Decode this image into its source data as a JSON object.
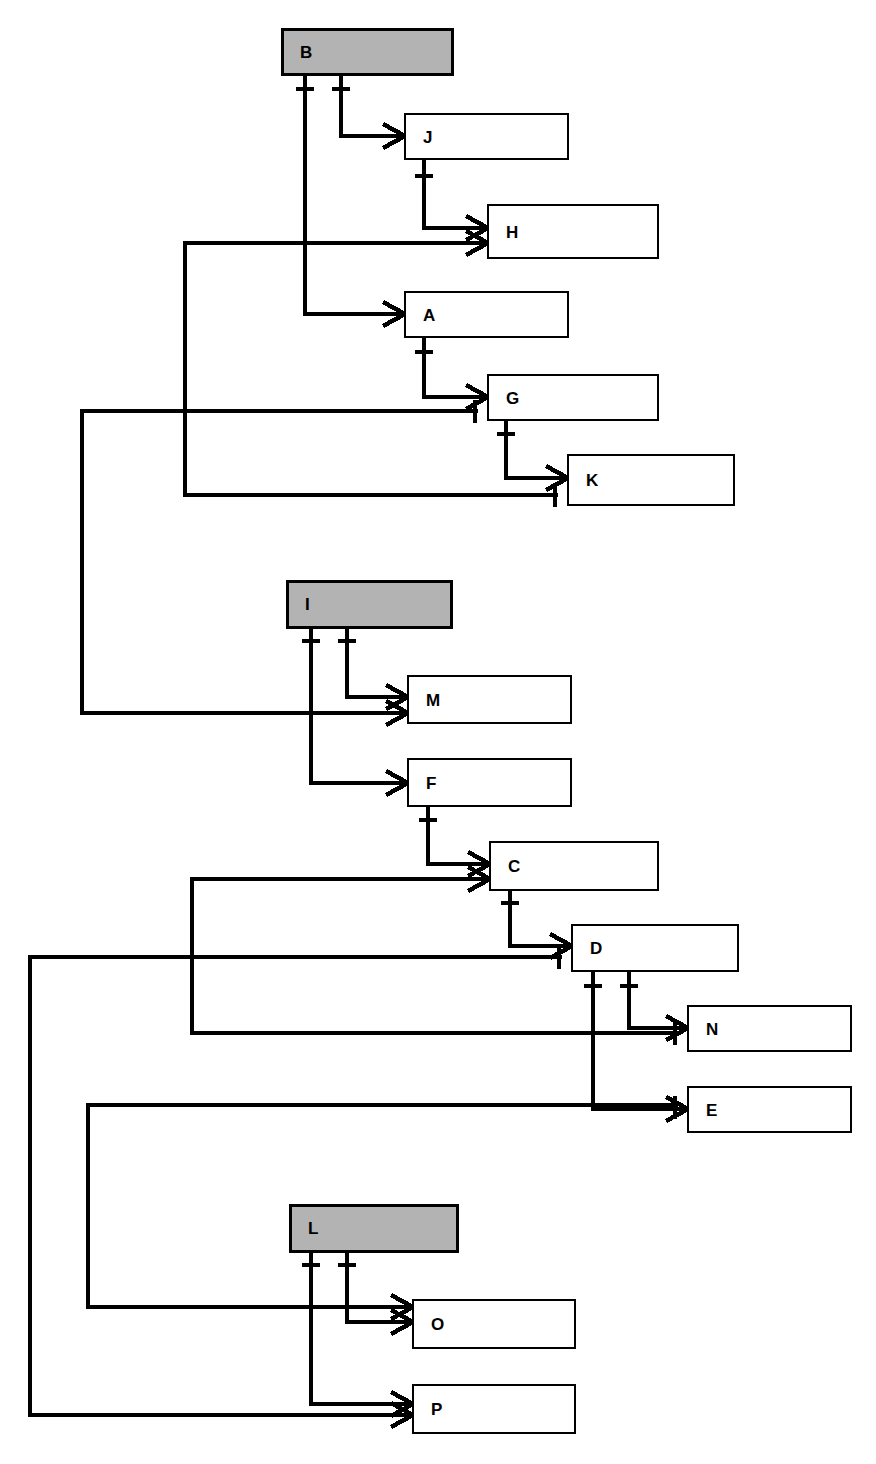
{
  "diagram": {
    "type": "crow-foot-er-diagram",
    "notation": "crow's foot (one-to-many)",
    "canvas": {
      "width": 876,
      "height": 1464
    },
    "colors": {
      "background": "#ffffff",
      "root_entity_fill": "#b3b3b3",
      "child_entity_fill": "#ffffff",
      "stroke": "#000000",
      "label_color": "#000000"
    },
    "legend": {
      "root_note": "Shaded boxes are root entities",
      "child_note": "Unshaded boxes are dependent entities",
      "one_symbol": "tick (|)",
      "many_symbol": "crow's foot"
    },
    "root_entities": [
      "B",
      "I",
      "L"
    ],
    "entities": [
      {
        "id": "B",
        "label": "B",
        "x": 282,
        "y": 29,
        "w": 170,
        "h": 45,
        "root": true
      },
      {
        "id": "J",
        "label": "J",
        "x": 405,
        "y": 114,
        "w": 163,
        "h": 45,
        "root": false
      },
      {
        "id": "H",
        "label": "H",
        "x": 488,
        "y": 205,
        "w": 170,
        "h": 53,
        "root": false
      },
      {
        "id": "A",
        "label": "A",
        "x": 405,
        "y": 292,
        "w": 163,
        "h": 45,
        "root": false
      },
      {
        "id": "G",
        "label": "G",
        "x": 488,
        "y": 375,
        "w": 170,
        "h": 45,
        "root": false
      },
      {
        "id": "K",
        "label": "K",
        "x": 568,
        "y": 455,
        "w": 166,
        "h": 50,
        "root": false
      },
      {
        "id": "I",
        "label": "I",
        "x": 287,
        "y": 581,
        "w": 164,
        "h": 46,
        "root": true
      },
      {
        "id": "M",
        "label": "M",
        "x": 408,
        "y": 676,
        "w": 163,
        "h": 47,
        "root": false
      },
      {
        "id": "F",
        "label": "F",
        "x": 408,
        "y": 759,
        "w": 163,
        "h": 47,
        "root": false
      },
      {
        "id": "C",
        "label": "C",
        "x": 490,
        "y": 842,
        "w": 168,
        "h": 48,
        "root": false
      },
      {
        "id": "D",
        "label": "D",
        "x": 572,
        "y": 925,
        "w": 166,
        "h": 46,
        "root": false
      },
      {
        "id": "N",
        "label": "N",
        "x": 688,
        "y": 1006,
        "w": 163,
        "h": 45,
        "root": false
      },
      {
        "id": "E",
        "label": "E",
        "x": 688,
        "y": 1087,
        "w": 163,
        "h": 45,
        "root": false
      },
      {
        "id": "L",
        "label": "L",
        "x": 290,
        "y": 1205,
        "w": 167,
        "h": 46,
        "root": true
      },
      {
        "id": "O",
        "label": "O",
        "x": 413,
        "y": 1300,
        "w": 162,
        "h": 48,
        "root": false
      },
      {
        "id": "P",
        "label": "P",
        "x": 413,
        "y": 1385,
        "w": 162,
        "h": 48,
        "root": false
      }
    ],
    "relationships": [
      {
        "from": "B",
        "to": "J",
        "from_card": "one",
        "to_card": "many"
      },
      {
        "from": "J",
        "to": "H",
        "from_card": "one",
        "to_card": "many"
      },
      {
        "from": "G",
        "to": "H",
        "from_card": "one",
        "to_card": "many"
      },
      {
        "from": "B",
        "to": "A",
        "from_card": "one",
        "to_card": "many"
      },
      {
        "from": "A",
        "to": "G",
        "from_card": "one",
        "to_card": "many"
      },
      {
        "from": "K",
        "to": "G",
        "from_card": "one",
        "to_card": "many"
      },
      {
        "from": "G",
        "to": "K",
        "from_card": "one",
        "to_card": "many"
      },
      {
        "from": "H",
        "to": "K",
        "from_card": "one",
        "to_card": "many"
      },
      {
        "from": "I",
        "to": "M",
        "from_card": "one",
        "to_card": "many"
      },
      {
        "from": "G",
        "to": "M",
        "from_card": "one",
        "to_card": "many"
      },
      {
        "from": "I",
        "to": "F",
        "from_card": "one",
        "to_card": "many"
      },
      {
        "from": "F",
        "to": "C",
        "from_card": "one",
        "to_card": "many"
      },
      {
        "from": "D",
        "to": "C",
        "from_card": "one",
        "to_card": "many"
      },
      {
        "from": "C",
        "to": "D",
        "from_card": "one",
        "to_card": "many"
      },
      {
        "from": "N",
        "to": "D",
        "from_card": "one",
        "to_card": "many"
      },
      {
        "from": "D",
        "to": "N",
        "from_card": "one",
        "to_card": "many"
      },
      {
        "from": "C",
        "to": "N",
        "from_card": "one",
        "to_card": "many"
      },
      {
        "from": "D",
        "to": "E",
        "from_card": "one",
        "to_card": "many"
      },
      {
        "from": "L",
        "to": "O",
        "from_card": "one",
        "to_card": "many"
      },
      {
        "from": "E",
        "to": "O",
        "from_card": "one",
        "to_card": "many"
      },
      {
        "from": "L",
        "to": "P",
        "from_card": "one",
        "to_card": "many"
      },
      {
        "from": "D",
        "to": "P",
        "from_card": "one",
        "to_card": "many"
      }
    ]
  }
}
